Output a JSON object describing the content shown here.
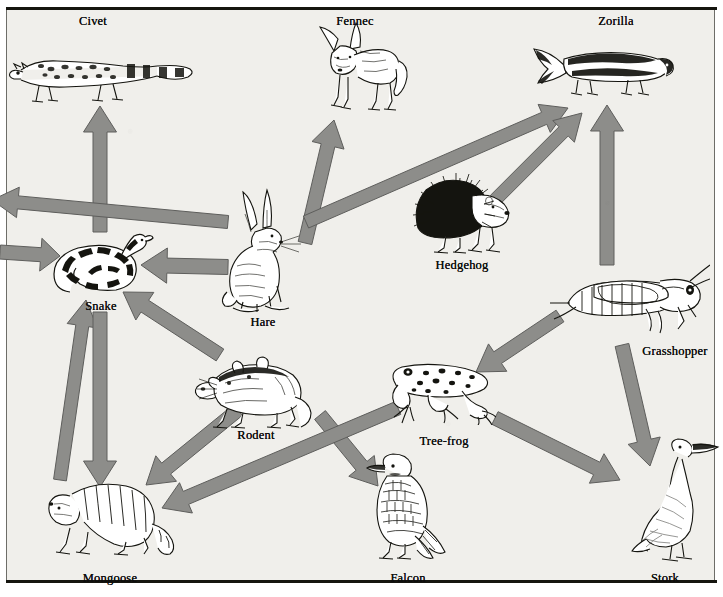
{
  "figure": {
    "kind": "food-web-diagram",
    "background_color": "#f0efeb",
    "arrow_fill": "#8d8d8a",
    "arrow_stroke": "#5e5e5c",
    "caption": "",
    "arrow_meaning": "arrow points from prey to predator"
  },
  "organisms": [
    {
      "id": "civet",
      "label": "Civet",
      "label_x": 93,
      "label_y": 14,
      "x": 100,
      "y": 73
    },
    {
      "id": "fennec",
      "label": "Fennec",
      "label_x": 355,
      "label_y": 14,
      "x": 358,
      "y": 65
    },
    {
      "id": "zorilla",
      "label": "Zorilla",
      "label_x": 616,
      "label_y": 14,
      "x": 602,
      "y": 70
    },
    {
      "id": "hedgehog",
      "label": "Hedgehog",
      "label_x": 462,
      "label_y": 258,
      "x": 462,
      "y": 212
    },
    {
      "id": "grasshopper",
      "label": "Grasshopper",
      "label_x": 675,
      "label_y": 344,
      "x": 630,
      "y": 297
    },
    {
      "id": "hare",
      "label": "Hare",
      "label_x": 263,
      "label_y": 315,
      "x": 263,
      "y": 250
    },
    {
      "id": "snake",
      "label": "Snake",
      "label_x": 101,
      "label_y": 299,
      "x": 100,
      "y": 263
    },
    {
      "id": "rodent",
      "label": "Rodent",
      "label_x": 256,
      "label_y": 428,
      "x": 252,
      "y": 389
    },
    {
      "id": "tree-frog",
      "label": "Tree-frog",
      "label_x": 444,
      "label_y": 434,
      "x": 440,
      "y": 390
    },
    {
      "id": "mongoose",
      "label": "Mongoose",
      "label_x": 110,
      "label_y": 571,
      "x": 110,
      "y": 512
    },
    {
      "id": "falcon",
      "label": "Falcon",
      "label_x": 408,
      "label_y": 571,
      "x": 405,
      "y": 505
    },
    {
      "id": "stork",
      "label": "Stork",
      "label_x": 665,
      "label_y": 571,
      "x": 668,
      "y": 500
    }
  ],
  "arrows": [
    {
      "from": "snake",
      "to": "civet",
      "x1": 100,
      "y1": 232,
      "x2": 100,
      "y2": 106,
      "width": 14
    },
    {
      "from": "hare",
      "to": "civet",
      "x1": 228,
      "y1": 222,
      "x2": -8,
      "y2": 200,
      "width": 13
    },
    {
      "from": "hare",
      "to": "snake",
      "x1": 228,
      "y1": 267,
      "x2": 141,
      "y2": 265,
      "width": 15
    },
    {
      "from": "hare",
      "to": "fennec",
      "x1": 305,
      "y1": 243,
      "x2": 334,
      "y2": 120,
      "width": 14
    },
    {
      "from": "hare",
      "to": "zorilla",
      "x1": 306,
      "y1": 222,
      "x2": 568,
      "y2": 108,
      "width": 13
    },
    {
      "from": "hedgehog",
      "to": "zorilla",
      "x1": 495,
      "y1": 200,
      "x2": 582,
      "y2": 113,
      "width": 13
    },
    {
      "from": "grasshopper",
      "to": "zorilla",
      "x1": 607,
      "y1": 265,
      "x2": 607,
      "y2": 105,
      "width": 14
    },
    {
      "from": "grasshopper",
      "to": "tree-frog",
      "x1": 560,
      "y1": 316,
      "x2": 476,
      "y2": 372,
      "width": 14
    },
    {
      "from": "grasshopper",
      "to": "stork",
      "x1": 622,
      "y1": 345,
      "x2": 650,
      "y2": 466,
      "width": 14
    },
    {
      "from": "mongoose",
      "to": "snake",
      "x1": 60,
      "y1": 480,
      "x2": 86,
      "y2": 300,
      "width": 13
    },
    {
      "from": "snake",
      "to": "mongoose",
      "x1": 100,
      "y1": 312,
      "x2": 100,
      "y2": 487,
      "width": 14
    },
    {
      "from": "rodent",
      "to": "snake",
      "x1": 220,
      "y1": 355,
      "x2": 123,
      "y2": 292,
      "width": 14
    },
    {
      "from": "rodent",
      "to": "mongoose",
      "x1": 238,
      "y1": 410,
      "x2": 146,
      "y2": 485,
      "width": 14
    },
    {
      "from": "rodent",
      "to": "falcon",
      "x1": 320,
      "y1": 415,
      "x2": 378,
      "y2": 486,
      "width": 14
    },
    {
      "from": "tree-frog",
      "to": "stork",
      "x1": 495,
      "y1": 418,
      "x2": 620,
      "y2": 480,
      "width": 14
    },
    {
      "from": "tree-frog",
      "to": "mongoose",
      "x1": 398,
      "y1": 408,
      "x2": 162,
      "y2": 508,
      "width": 14
    },
    {
      "from": "snake",
      "to": "civet2",
      "x1": 0,
      "y1": 252,
      "x2": 60,
      "y2": 256,
      "width": 14
    }
  ]
}
